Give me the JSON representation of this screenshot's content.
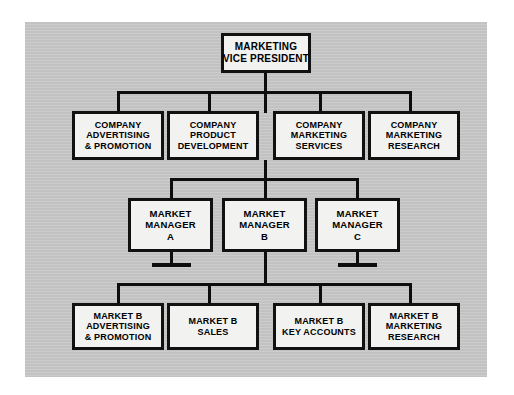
{
  "diagram": {
    "title_visible": false,
    "panel_color": "#c9c9c9",
    "box_fill": "#f2f2f0",
    "line_color": "#0d0d0d",
    "nodes": {
      "vp": {
        "lines": [
          "MARKETING",
          "VICE PRESIDENT"
        ]
      },
      "corp": [
        {
          "lines": [
            "COMPANY",
            "ADVERTISING",
            "& PROMOTION"
          ]
        },
        {
          "lines": [
            "COMPANY",
            "PRODUCT",
            "DEVELOPMENT"
          ]
        },
        {
          "lines": [
            "COMPANY",
            "MARKETING",
            "SERVICES"
          ]
        },
        {
          "lines": [
            "COMPANY",
            "MARKETING",
            "RESEARCH"
          ]
        }
      ],
      "managers": [
        {
          "lines": [
            "MARKET",
            "MANAGER",
            "A"
          ]
        },
        {
          "lines": [
            "MARKET",
            "MANAGER",
            "B"
          ]
        },
        {
          "lines": [
            "MARKET",
            "MANAGER",
            "C"
          ]
        }
      ],
      "market_b_functions": [
        {
          "lines": [
            "MARKET B",
            "ADVERTISING",
            "& PROMOTION"
          ]
        },
        {
          "lines": [
            "MARKET B",
            "SALES"
          ]
        },
        {
          "lines": [
            "MARKET B",
            "KEY ACCOUNTS"
          ]
        },
        {
          "lines": [
            "MARKET B",
            "MARKETING",
            "RESEARCH"
          ]
        }
      ]
    }
  }
}
